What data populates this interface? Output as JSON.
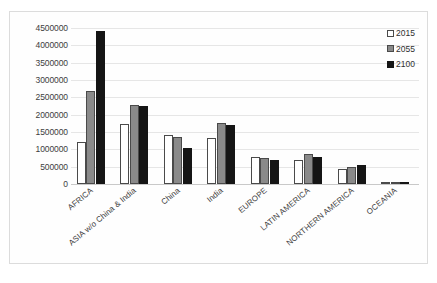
{
  "chart_data": {
    "type": "bar",
    "title": "",
    "subtitle": "",
    "xlabel": "",
    "ylabel": "",
    "grid": true,
    "legend_position": "top-right",
    "ylim": [
      0,
      4500000
    ],
    "ytick_step": 500000,
    "yticks": [
      "4500000",
      "4000000",
      "3500000",
      "3000000",
      "2500000",
      "2000000",
      "1500000",
      "1000000",
      "500000",
      "0"
    ],
    "categories": [
      "AFRICA",
      "ASIA w/o China & India",
      "China",
      "India",
      "EUROPE",
      "LATIN AMERICA",
      "NORTHERN AMERICA",
      "OCEANIA"
    ],
    "series": [
      {
        "name": "2015",
        "color": "#ffffff",
        "values": [
          1200000,
          1730000,
          1410000,
          1340000,
          780000,
          680000,
          420000,
          40000
        ]
      },
      {
        "name": "2055",
        "color": "#8a8a8a",
        "values": [
          2680000,
          2290000,
          1350000,
          1770000,
          740000,
          860000,
          500000,
          60000
        ]
      },
      {
        "name": "2100",
        "color": "#151515",
        "values": [
          4420000,
          2250000,
          1050000,
          1710000,
          690000,
          780000,
          560000,
          70000
        ]
      }
    ]
  },
  "legend": {
    "items": [
      {
        "label": "2015",
        "swatch": "white-square-icon"
      },
      {
        "label": "2055",
        "swatch": "gray-square-icon"
      },
      {
        "label": "2100",
        "swatch": "black-square-icon"
      }
    ]
  }
}
